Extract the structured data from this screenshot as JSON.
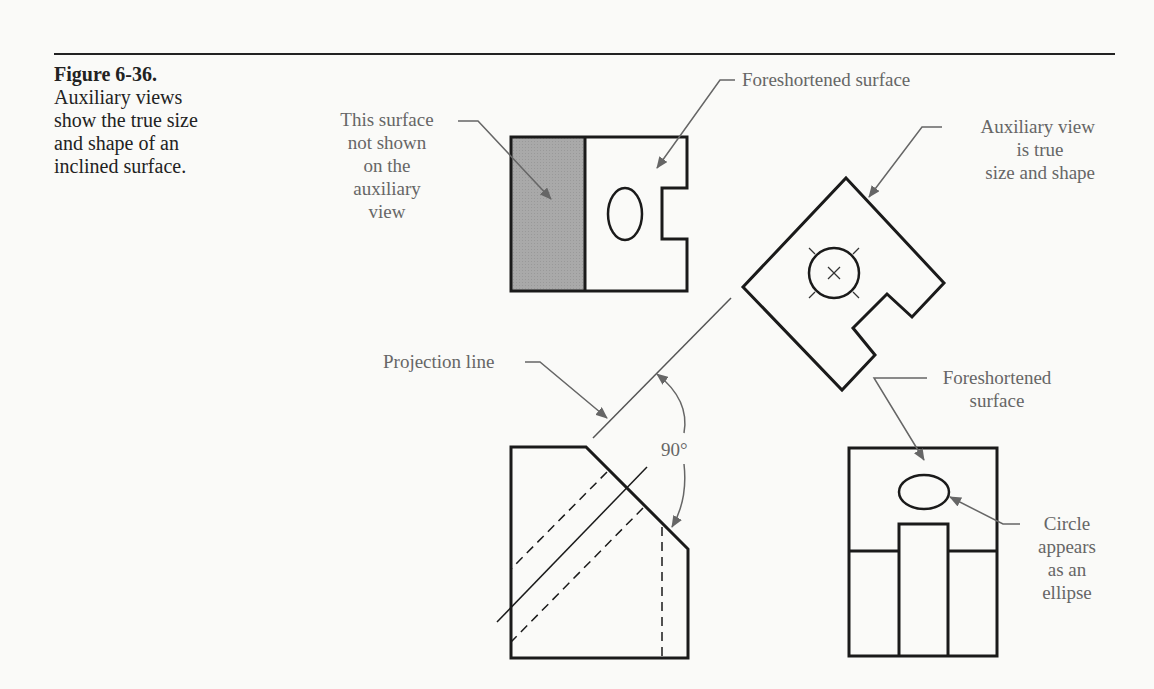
{
  "figure": {
    "number": "Figure 6-36.",
    "caption_lines": [
      "Auxiliary views",
      "show the true size",
      "and shape of an",
      "inclined surface."
    ]
  },
  "labels": {
    "not_shown": [
      "This surface",
      "not shown",
      "on the",
      "auxiliary",
      "view"
    ],
    "foreshortened_top": "Foreshortened surface",
    "auxiliary": [
      "Auxiliary view",
      "is true",
      "size and shape"
    ],
    "projection_line": "Projection line",
    "angle": "90°",
    "foreshortened_side": [
      "Foreshortened",
      "surface"
    ],
    "circle_ellipse": [
      "Circle",
      "appears",
      "as an",
      "ellipse"
    ]
  },
  "colors": {
    "ink": "#1a1a1a",
    "label": "#666666",
    "shade": "#a9a9a9",
    "background": "#fafaf8"
  },
  "views": [
    "top-view",
    "auxiliary-view",
    "front-view",
    "side-view"
  ]
}
